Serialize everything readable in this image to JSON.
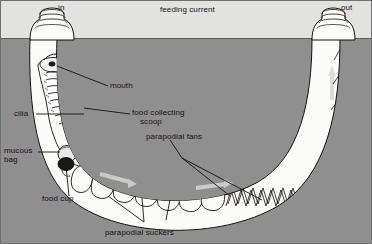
{
  "figure": {
    "domain_type": "biological-diagram",
    "colors": {
      "water": "#e2e2e0",
      "sediment": "#8f8f8f",
      "burrow_lumen": "#fbfbfa",
      "ink": "#14120f",
      "frame": "#6f6f6f",
      "seabed_line": "#5d5d5d",
      "current_arrow": "#d8d8d6"
    }
  },
  "labels": {
    "inlet": "in",
    "outlet": "out",
    "feeding_current": "feeding current",
    "mouth": "mouth",
    "cilia": "cilia",
    "food_collecting_scoop_line1": "food collecting",
    "food_collecting_scoop_line2": "scoop",
    "mucous_bag_line1": "mucous",
    "mucous_bag_line2": "bag",
    "food_cup": "food cup",
    "parapodial_fans": "parapodial fans",
    "parapodial_suckers": "parapodial suckers"
  },
  "regions": {
    "water_zone": "open water above the sediment surface",
    "sediment_zone": "sediment in which the U-tube is buried",
    "seabed": "sediment surface line"
  },
  "structures": {
    "inlet_chimney": "ringed inhalant chimney projecting above the sediment at the left",
    "outlet_chimney": "ringed exhalant chimney projecting above the sediment at the right",
    "burrow_tube": "U-shaped parchment tube lumen",
    "worm_head": "anterior end of the worm with mouth and ciliated feeding structures",
    "mucous_bag": "mucous net bag suspended across the tube",
    "food_cup": "ciliated cup that rolls the food-laden mucus into a bolus",
    "parapodial_fans": "three enlarged fan-shaped parapodia that pump water through the tube",
    "parapodial_suckers": "sucker-like parapodia gripping the tube wall",
    "chaetae_row": "row of zigzag chaetae along the lower and right inner tube wall"
  },
  "flow": {
    "direction": "water enters at the left inlet, passes through the mucous bag, and exits at the right outlet",
    "arrow_count": 4
  }
}
